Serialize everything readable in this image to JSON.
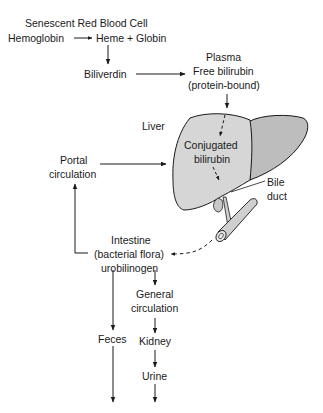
{
  "diagram": {
    "colors": {
      "text": "#1a1a1a",
      "line": "#1a1a1a",
      "liver_fill": "#d6d6d6",
      "liver_shade": "#bdbdbd",
      "duct_fill": "#cfcfcf"
    },
    "nodes": {
      "senescent_rbc": "Senescent Red Blood Cell",
      "hemoglobin": "Hemoglobin",
      "heme_globin": "Heme + Globin",
      "biliverdin": "Biliverdin",
      "plasma": "Plasma",
      "free_bilirubin": "Free bilirubin",
      "protein_bound": "(protein-bound)",
      "liver": "Liver",
      "conjugated": "Conjugated",
      "bilirubin": "bilirubin",
      "portal": "Portal",
      "portal_circ": "circulation",
      "bile": "Bile",
      "duct": "duct",
      "intestine": "Intestine",
      "bacterial_flora": "(bacterial flora)",
      "urobilinogen": "urobilinogen",
      "general": "General",
      "general_circ": "circulation",
      "feces": "Feces",
      "kidney": "Kidney",
      "urine": "Urine"
    },
    "edges": [
      {
        "from": "Hemoglobin",
        "to": "Heme + Globin",
        "style": "solid"
      },
      {
        "from": "Heme + Globin",
        "to": "Biliverdin",
        "style": "solid"
      },
      {
        "from": "Biliverdin",
        "to": "Plasma free bilirubin",
        "style": "solid"
      },
      {
        "from": "Plasma free bilirubin",
        "to": "Liver",
        "style": "solid"
      },
      {
        "from": "Liver",
        "to": "Conjugated bilirubin",
        "style": "dashed"
      },
      {
        "from": "Conjugated bilirubin",
        "to": "Bile duct",
        "style": "dashed"
      },
      {
        "from": "Bile duct",
        "to": "Intestine",
        "style": "dashed"
      },
      {
        "from": "Intestine",
        "to": "Portal circulation",
        "style": "solid"
      },
      {
        "from": "Portal circulation",
        "to": "Liver",
        "style": "solid"
      },
      {
        "from": "Urobilinogen",
        "to": "Feces",
        "style": "solid"
      },
      {
        "from": "Urobilinogen",
        "to": "General circulation",
        "style": "solid"
      },
      {
        "from": "General circulation",
        "to": "Kidney",
        "style": "solid"
      },
      {
        "from": "Kidney",
        "to": "Urine",
        "style": "solid"
      }
    ]
  }
}
